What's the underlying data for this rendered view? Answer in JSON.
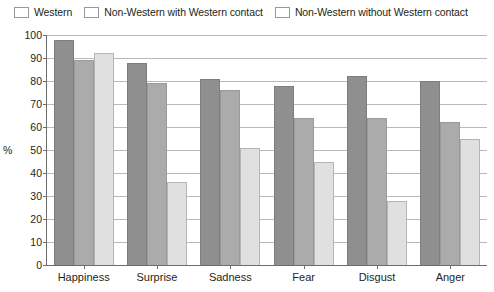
{
  "chart_data": {
    "type": "bar",
    "title": "",
    "xlabel": "",
    "ylabel": "%",
    "ylim": [
      0,
      100
    ],
    "yticks": [
      0,
      10,
      20,
      30,
      40,
      50,
      60,
      70,
      80,
      90,
      100
    ],
    "grid": true,
    "legend_position": "top-left",
    "categories": [
      "Happiness",
      "Surprise",
      "Sadness",
      "Fear",
      "Disgust",
      "Anger"
    ],
    "series": [
      {
        "name": "Western",
        "color": "#8f8f8f",
        "values": [
          98,
          88,
          81,
          78,
          82,
          80
        ]
      },
      {
        "name": "Non-Western with Western contact",
        "color": "#ababab",
        "values": [
          89,
          79,
          76,
          64,
          64,
          62
        ]
      },
      {
        "name": "Non-Western without Western contact",
        "color": "#e0e0e0",
        "values": [
          92,
          36,
          51,
          45,
          28,
          55
        ]
      }
    ]
  }
}
